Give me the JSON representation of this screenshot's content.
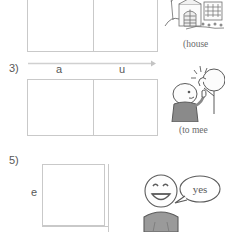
{
  "worksheet": {
    "exercises": [
      {
        "number": "",
        "id": "table-top",
        "columns": 2,
        "headers": [],
        "row_label": "",
        "note": "top exercise table cropped by page edge"
      },
      {
        "number": "3)",
        "id": "table-mid",
        "columns": 2,
        "headers": [
          "a",
          "u"
        ],
        "row_label": ""
      },
      {
        "number": "5)",
        "id": "table-bot",
        "columns": 2,
        "headers": [],
        "row_label": "e",
        "note": "bottom exercise table cropped by page edge"
      }
    ],
    "axis": {
      "name": "progress-arrow",
      "direction": "right",
      "color": "#d0d0d0"
    },
    "illustrations": [
      {
        "id": "illus-house",
        "icon": "house-illustration",
        "caption": "(house",
        "caption_truncated": true
      },
      {
        "id": "illus-meet",
        "icon": "people-greeting-illustration",
        "caption": "(to mee",
        "caption_truncated": true
      },
      {
        "id": "illus-yes",
        "icon": "smiling-person-illustration",
        "caption": "",
        "speech_bubble": "yes"
      }
    ]
  },
  "colors": {
    "rule": "#c9c9c9",
    "text": "#585858",
    "caption": "#6a6a6a",
    "arrow": "#d0d0d0",
    "ink": "#5b5b5b",
    "shirt": "#8e8e8e"
  }
}
